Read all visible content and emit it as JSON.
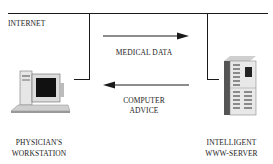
{
  "diagram": {
    "network_label": "INTERNET",
    "arrows": [
      {
        "label": "MEDICAL DATA",
        "direction": "right"
      },
      {
        "label_line1": "COMPUTER",
        "label_line2": "ADVICE",
        "direction": "left"
      }
    ],
    "nodes": [
      {
        "id": "workstation",
        "label_line1": "PHYSICIAN'S",
        "label_line2": "WORKSTATION",
        "icon": "desktop-computer-icon"
      },
      {
        "id": "server",
        "label_line1": "INTELLIGENT",
        "label_line2": "WWW-SERVER",
        "icon": "tower-server-icon"
      }
    ],
    "colors": {
      "line": "#1a1a1a",
      "background": "#ffffff"
    }
  }
}
